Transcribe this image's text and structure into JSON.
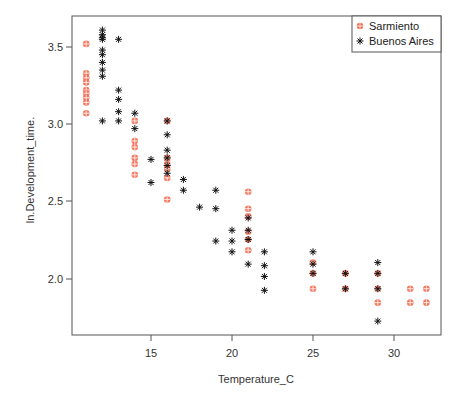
{
  "chart_data": {
    "type": "scatter",
    "title": "",
    "xlabel": "Temperature_C",
    "ylabel": "ln.Development_time.",
    "xlim": [
      10.2,
      33.0
    ],
    "ylim": [
      1.66,
      3.69
    ],
    "xticks": [
      15,
      20,
      25,
      30
    ],
    "yticks": [
      2.0,
      2.5,
      3.0,
      3.5
    ],
    "grid": false,
    "legend_position": "top-right",
    "series": [
      {
        "name": "Sarmiento",
        "marker": "circle-plus",
        "color": "#f4694f",
        "points": [
          [
            11,
            3.52
          ],
          [
            11,
            3.33
          ],
          [
            11,
            3.3
          ],
          [
            11,
            3.27
          ],
          [
            11,
            3.22
          ],
          [
            11,
            3.2
          ],
          [
            11,
            3.17
          ],
          [
            11,
            3.14
          ],
          [
            11,
            3.07
          ],
          [
            14,
            3.02
          ],
          [
            14,
            2.89
          ],
          [
            14,
            2.85
          ],
          [
            14,
            2.78
          ],
          [
            14,
            2.74
          ],
          [
            14,
            2.67
          ],
          [
            16,
            3.02
          ],
          [
            16,
            2.78
          ],
          [
            16,
            2.74
          ],
          [
            16,
            2.71
          ],
          [
            16,
            2.65
          ],
          [
            16,
            2.51
          ],
          [
            21,
            2.56
          ],
          [
            21,
            2.45
          ],
          [
            21,
            2.4
          ],
          [
            21,
            2.3
          ],
          [
            21,
            2.25
          ],
          [
            21,
            2.18
          ],
          [
            25,
            2.1
          ],
          [
            25,
            2.03
          ],
          [
            25,
            1.93
          ],
          [
            27,
            2.03
          ],
          [
            27,
            1.93
          ],
          [
            29,
            2.03
          ],
          [
            29,
            1.93
          ],
          [
            29,
            1.84
          ],
          [
            31,
            1.93
          ],
          [
            31,
            1.84
          ],
          [
            32,
            1.93
          ],
          [
            32,
            1.84
          ]
        ]
      },
      {
        "name": "Buenos Aires",
        "marker": "asterisk",
        "color": "#111111",
        "points": [
          [
            12,
            3.61
          ],
          [
            12,
            3.58
          ],
          [
            12,
            3.56
          ],
          [
            12,
            3.55
          ],
          [
            12,
            3.48
          ],
          [
            12,
            3.45
          ],
          [
            12,
            3.4
          ],
          [
            12,
            3.35
          ],
          [
            12,
            3.31
          ],
          [
            12,
            3.02
          ],
          [
            13,
            3.55
          ],
          [
            13,
            3.22
          ],
          [
            13,
            3.16
          ],
          [
            13,
            3.08
          ],
          [
            13,
            3.02
          ],
          [
            14,
            3.07
          ],
          [
            14,
            2.97
          ],
          [
            15,
            2.77
          ],
          [
            15,
            2.62
          ],
          [
            16,
            3.02
          ],
          [
            16,
            2.93
          ],
          [
            16,
            2.83
          ],
          [
            16,
            2.78
          ],
          [
            16,
            2.73
          ],
          [
            16,
            2.68
          ],
          [
            17,
            2.64
          ],
          [
            17,
            2.57
          ],
          [
            18,
            2.46
          ],
          [
            19,
            2.57
          ],
          [
            19,
            2.45
          ],
          [
            19,
            2.24
          ],
          [
            20,
            2.31
          ],
          [
            20,
            2.24
          ],
          [
            20,
            2.17
          ],
          [
            21,
            2.39
          ],
          [
            21,
            2.31
          ],
          [
            21,
            2.25
          ],
          [
            21,
            2.09
          ],
          [
            22,
            2.17
          ],
          [
            22,
            2.08
          ],
          [
            22,
            2.01
          ],
          [
            22,
            1.92
          ],
          [
            25,
            2.17
          ],
          [
            25,
            2.09
          ],
          [
            25,
            2.03
          ],
          [
            27,
            2.03
          ],
          [
            27,
            1.93
          ],
          [
            29,
            2.1
          ],
          [
            29,
            2.03
          ],
          [
            29,
            1.93
          ],
          [
            29,
            1.72
          ]
        ]
      }
    ]
  },
  "legend": {
    "items": [
      {
        "label": "Sarmiento"
      },
      {
        "label": "Buenos Aires"
      }
    ]
  },
  "axes": {
    "x_tick_labels": [
      "15",
      "20",
      "25",
      "30"
    ],
    "y_tick_labels": [
      "2.0",
      "2.5",
      "3.0",
      "3.5"
    ],
    "xlabel": "Temperature_C",
    "ylabel": "ln.Development_time."
  },
  "colors": {
    "sarmiento": "#f4694f",
    "buenos_aires": "#111111",
    "axis": "#555555"
  }
}
